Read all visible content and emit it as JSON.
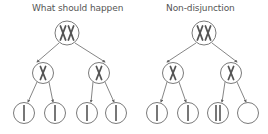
{
  "panels": [
    {
      "title": "What should happen",
      "top_cell": {
        "chromosomes": "XX"
      },
      "middle_cells": [
        {
          "chromosomes": "X"
        },
        {
          "chromosomes": "X"
        }
      ],
      "gametes": [
        {
          "chromatids": 1
        },
        {
          "chromatids": 1
        },
        {
          "chromatids": 1
        },
        {
          "chromatids": 1
        }
      ]
    },
    {
      "title": "Non-disjunction",
      "top_cell": {
        "chromosomes": "XX"
      },
      "middle_cells": [
        {
          "chromosomes": "X"
        },
        {
          "chromosomes": "X"
        }
      ],
      "gametes": [
        {
          "chromatids": 1
        },
        {
          "chromatids": 1
        },
        {
          "chromatids": 2
        },
        {
          "chromatids": 0
        }
      ]
    }
  ],
  "colors": {
    "circle": "#7a7a7a",
    "chromosome": "#555555",
    "arrow": "#666666",
    "text": "#555555"
  }
}
